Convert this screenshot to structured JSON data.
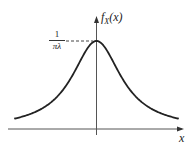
{
  "figure": {
    "type": "probability-density-plot",
    "distribution": "Cauchy",
    "y_axis_label": "f_X(x)",
    "y_axis_label_parts": {
      "f": "f",
      "sub": "X",
      "arg": "(x)"
    },
    "x_axis_label": "x",
    "peak_label": {
      "numerator": "1",
      "denominator": "πλ"
    },
    "colors": {
      "curve": "#222222",
      "axes": "#555555",
      "dashed": "#444444",
      "background": "#ffffff"
    }
  },
  "chart_data": {
    "type": "line",
    "title": "",
    "xlabel": "x",
    "ylabel": "f_X(x)",
    "series": [
      {
        "name": "f_X(x) = 1 / (πλ(1 + (x/λ)²))",
        "shape": "Cauchy bell curve centered at 0"
      }
    ],
    "annotations": [
      {
        "text": "1/(πλ)",
        "at": "peak value at x = 0",
        "style": "dashed horizontal guide to y-axis"
      }
    ],
    "grid": false,
    "legend": false,
    "ticks": "none"
  }
}
